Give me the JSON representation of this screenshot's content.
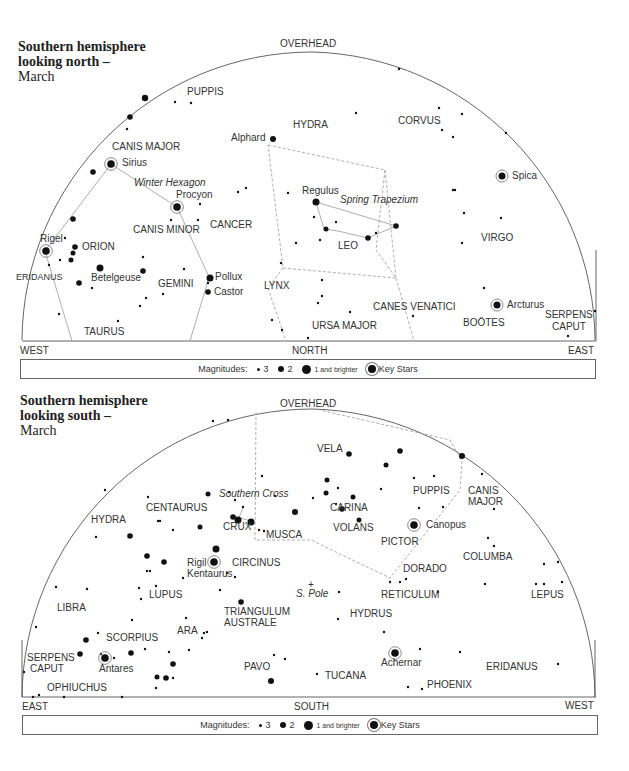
{
  "north": {
    "title": [
      "Southern hemisphere",
      "looking north –",
      "March"
    ],
    "directions": {
      "top": "OVERHEAD",
      "left": "WEST",
      "center": "NORTH",
      "right": "EAST"
    },
    "legend": {
      "prefix": "Magnitudes:",
      "m3": "3",
      "m2": "2",
      "m1": "1 and brighter",
      "key": "Key Stars"
    },
    "constellations": [
      {
        "name": "PUPPIS",
        "x": 187,
        "y": 95
      },
      {
        "name": "HYDRA",
        "x": 293,
        "y": 128
      },
      {
        "name": "CORVUS",
        "x": 398,
        "y": 124
      },
      {
        "name": "CANIS MAJOR",
        "x": 112,
        "y": 150
      },
      {
        "name": "CANIS MINOR",
        "x": 133,
        "y": 233
      },
      {
        "name": "CANCER",
        "x": 210,
        "y": 228
      },
      {
        "name": "ORION",
        "x": 82,
        "y": 250
      },
      {
        "name": "VIRGO",
        "x": 481,
        "y": 241
      },
      {
        "name": "LEO",
        "x": 338,
        "y": 249
      },
      {
        "name": "GEMINI",
        "x": 158,
        "y": 287
      },
      {
        "name": "ERIDANUS",
        "x": 16,
        "y": 280,
        "small": true
      },
      {
        "name": "LYNX",
        "x": 264,
        "y": 289
      },
      {
        "name": "CANES VENATICI",
        "x": 373,
        "y": 310
      },
      {
        "name": "TAURUS",
        "x": 84,
        "y": 335
      },
      {
        "name": "URSA MAJOR",
        "x": 312,
        "y": 329
      },
      {
        "name": "BOÖTES",
        "x": 463,
        "y": 326
      },
      {
        "name": "SERPENS",
        "x": 545,
        "y": 318
      },
      {
        "name": "CAPUT",
        "x": 552,
        "y": 330
      }
    ],
    "named_stars": [
      {
        "name": "Alphard",
        "x": 231,
        "y": 141
      },
      {
        "name": "Sirius",
        "x": 122,
        "y": 166
      },
      {
        "name": "Procyon",
        "x": 176,
        "y": 198
      },
      {
        "name": "Spica",
        "x": 512,
        "y": 179
      },
      {
        "name": "Regulus",
        "x": 302,
        "y": 194
      },
      {
        "name": "Rigel",
        "x": 40,
        "y": 242
      },
      {
        "name": "Betelgeuse",
        "x": 91,
        "y": 281
      },
      {
        "name": "Pollux",
        "x": 215,
        "y": 280
      },
      {
        "name": "Castor",
        "x": 214,
        "y": 295
      },
      {
        "name": "Arcturus",
        "x": 507,
        "y": 308
      }
    ],
    "asterisms": [
      {
        "name": "Winter Hexagon",
        "x": 134,
        "y": 186
      },
      {
        "name": "Spring Trapezium",
        "x": 340,
        "y": 203
      }
    ]
  },
  "south": {
    "title": [
      "Southern hemisphere",
      "looking south –",
      "March"
    ],
    "directions": {
      "top": "OVERHEAD",
      "left": "EAST",
      "center": "SOUTH",
      "right": "WEST"
    },
    "legend": {
      "prefix": "Magnitudes:",
      "m3": "3",
      "m2": "2",
      "m1": "1 and brighter",
      "key": "Key Stars"
    },
    "constellations": [
      {
        "name": "VELA",
        "x": 317,
        "y": 452
      },
      {
        "name": "PUPPIS",
        "x": 413,
        "y": 494
      },
      {
        "name": "CANIS",
        "x": 468,
        "y": 494
      },
      {
        "name": "MAJOR",
        "x": 468,
        "y": 505
      },
      {
        "name": "CENTAURUS",
        "x": 146,
        "y": 511
      },
      {
        "name": "CARINA",
        "x": 330,
        "y": 511
      },
      {
        "name": "HYDRA",
        "x": 91,
        "y": 523
      },
      {
        "name": "CRUX",
        "x": 223,
        "y": 530
      },
      {
        "name": "MUSCA",
        "x": 266,
        "y": 538
      },
      {
        "name": "VOLANS",
        "x": 333,
        "y": 531
      },
      {
        "name": "PICTOR",
        "x": 381,
        "y": 545
      },
      {
        "name": "COLUMBA",
        "x": 463,
        "y": 560
      },
      {
        "name": "CIRCINUS",
        "x": 232,
        "y": 566
      },
      {
        "name": "DORADO",
        "x": 403,
        "y": 572
      },
      {
        "name": "LUPUS",
        "x": 149,
        "y": 598
      },
      {
        "name": "RETICULUM",
        "x": 381,
        "y": 598
      },
      {
        "name": "LEPUS",
        "x": 531,
        "y": 598
      },
      {
        "name": "LIBRA",
        "x": 57,
        "y": 611
      },
      {
        "name": "TRIANGULUM",
        "x": 224,
        "y": 615
      },
      {
        "name": "AUSTRALE",
        "x": 224,
        "y": 626
      },
      {
        "name": "HYDRUS",
        "x": 350,
        "y": 617
      },
      {
        "name": "ARA",
        "x": 177,
        "y": 634
      },
      {
        "name": "SCORPIUS",
        "x": 106,
        "y": 641
      },
      {
        "name": "SERPENS",
        "x": 27,
        "y": 661
      },
      {
        "name": "CAPUT",
        "x": 30,
        "y": 672
      },
      {
        "name": "PAVO",
        "x": 244,
        "y": 670
      },
      {
        "name": "ERIDANUS",
        "x": 486,
        "y": 670
      },
      {
        "name": "TUCANA",
        "x": 325,
        "y": 679
      },
      {
        "name": "OPHIUCHUS",
        "x": 47,
        "y": 691
      },
      {
        "name": "PHOENIX",
        "x": 427,
        "y": 688
      }
    ],
    "named_stars": [
      {
        "name": "Canopus",
        "x": 426,
        "y": 528
      },
      {
        "name": "Rigil",
        "x": 187,
        "y": 566
      },
      {
        "name": "Kentaurus",
        "x": 187,
        "y": 577
      },
      {
        "name": "Antares",
        "x": 99,
        "y": 672
      },
      {
        "name": "Achernar",
        "x": 381,
        "y": 666
      }
    ],
    "asterisms": [
      {
        "name": "Southern Cross",
        "x": 219,
        "y": 497
      },
      {
        "name": "S. Pole",
        "x": 296,
        "y": 597
      }
    ]
  }
}
